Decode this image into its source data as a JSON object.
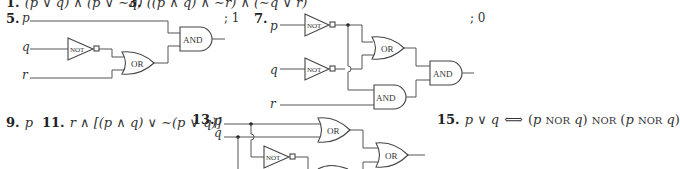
{
  "top_line": {
    "item1": {
      "number": "1.",
      "expr": "(p ∨ q) ∧ (p ∨ ∼q)"
    },
    "item3": {
      "number": "3.",
      "expr": "((p ∧ q) ∧ ∼r) ∧ (∼q ∨ r)"
    }
  },
  "item5": {
    "number": "5.",
    "inputs": [
      "p",
      "q",
      "r"
    ],
    "gates": [
      "NOT",
      "OR",
      "AND"
    ],
    "answer": "; 1"
  },
  "item7": {
    "number": "7.",
    "inputs": [
      "p",
      "q",
      "r"
    ],
    "gates": [
      "NOT",
      "NOT",
      "OR",
      "AND",
      "AND"
    ],
    "answer": "; 0"
  },
  "item9": {
    "number": "9.",
    "expr": "p"
  },
  "item11": {
    "number": "11.",
    "expr": "r ∧ [(p ∧ q) ∨ ∼(p ∨ q)]"
  },
  "item13": {
    "number": "13.",
    "inputs": [
      "p",
      "q"
    ],
    "gates": [
      "OR",
      "NOT",
      "OR"
    ]
  },
  "item15": {
    "number": "15.",
    "lhs": "p ∨ q",
    "iff": "⟺",
    "rhs_parts": [
      "(",
      "p",
      "NOR",
      "q",
      ")",
      "NOR",
      "(",
      "p",
      "NOR",
      "q",
      ")"
    ]
  },
  "gate_labels": {
    "not": "NOT",
    "or": "OR",
    "and": "AND"
  }
}
